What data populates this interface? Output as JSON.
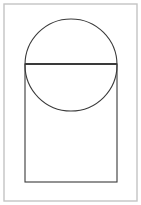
{
  "figure": {
    "background_color": "#ffffff",
    "width": 141,
    "height": 205
  },
  "frame": {
    "name": "outer-frame",
    "stroke_color": "#c4c4c4",
    "stroke_width": 1.4,
    "x": 4,
    "y": 4,
    "width": 133,
    "height": 197
  },
  "shapes": {
    "stroke_color": "#3a3a3a",
    "stroke_width": 1.1,
    "rectangle": {
      "name": "rectangle",
      "x": 25,
      "y": 64,
      "width": 92,
      "height": 118,
      "left": 25,
      "right": 117,
      "top": 64,
      "bottom": 182
    },
    "circle": {
      "name": "circle",
      "center_x": 71,
      "center_y": 65,
      "radius": 46,
      "top": 19,
      "bottom": 111,
      "left": 25,
      "right": 117
    },
    "chord": {
      "name": "horizontal-chord",
      "x1": 25,
      "y1": 64,
      "x2": 117,
      "y2": 64,
      "length": 92
    }
  },
  "labels": {
    "has_text_labels": false,
    "items": []
  }
}
